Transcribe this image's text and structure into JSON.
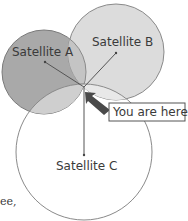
{
  "diagram": {
    "title": "",
    "satellites": [
      {
        "label": "Satellite A",
        "cx": 44,
        "cy": 72,
        "r": 42,
        "fill": "#a9a9a9"
      },
      {
        "label": "Satellite B",
        "cx": 116,
        "cy": 52,
        "r": 48,
        "fill": "#d9d9d9"
      },
      {
        "label": "Satellite C",
        "cx": 84,
        "cy": 152,
        "r": 68,
        "fill": "#ffffff"
      }
    ],
    "callout": {
      "label": "You are here"
    },
    "truncated_text": "ee,"
  },
  "colors": {
    "stroke": "#7a7a7a",
    "arrow": "#4a4a4a",
    "text": "#3a3a3a"
  }
}
